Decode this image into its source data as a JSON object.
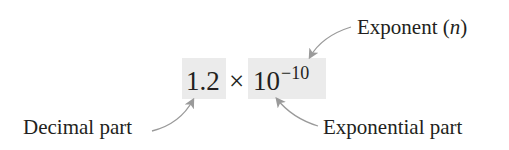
{
  "expression": {
    "coefficient": "1.2",
    "times": "×",
    "base": "10",
    "exponent": "−10"
  },
  "labels": {
    "exponent": "Exponent (n)",
    "exponent_prefix": "Exponent (",
    "exponent_var": "n",
    "exponent_suffix": ")",
    "decimal_part": "Decimal part",
    "exponential_part": "Exponential part"
  },
  "colors": {
    "highlight_box": "#ebebeb",
    "arrow": "#9a9a9a",
    "text": "#231f20"
  }
}
